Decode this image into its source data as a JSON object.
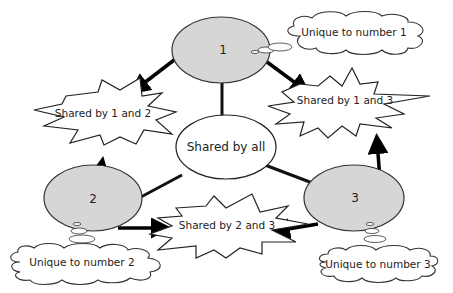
{
  "diagram": {
    "type": "relationship-diagram",
    "colors": {
      "circle_fill": "#d6d6d6",
      "stroke": "#222222",
      "arrow": "#000000",
      "background": "#ffffff"
    },
    "circles": [
      {
        "id": "1",
        "label": "1"
      },
      {
        "id": "2",
        "label": "2"
      },
      {
        "id": "3",
        "label": "3"
      }
    ],
    "center": {
      "label": "Shared by all"
    },
    "bursts": [
      {
        "id": "s12",
        "label": "Shared by 1 and 2"
      },
      {
        "id": "s13",
        "label": "Shared by 1 and 3"
      },
      {
        "id": "s23",
        "label": "Shared by 2 and 3"
      }
    ],
    "clouds": [
      {
        "id": "u1",
        "label": "Unique to number 1"
      },
      {
        "id": "u2",
        "label": "Unique to number 2"
      },
      {
        "id": "u3",
        "label": "Unique to number 3"
      }
    ]
  }
}
